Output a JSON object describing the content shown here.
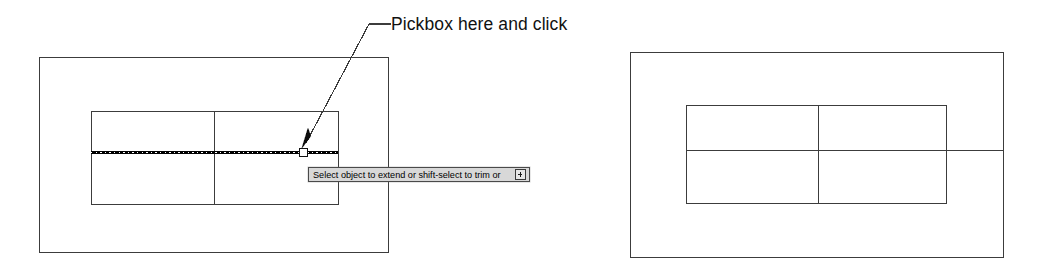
{
  "figure": {
    "annotation_label": "Pickbox here and click",
    "tooltip": {
      "text": "Select object to extend or shift-select to trim or",
      "icon": "expand-box-icon"
    },
    "colors": {
      "line": "#3c3c3c",
      "bold_line": "#000000",
      "tooltip_background": "#d8d8d8",
      "tooltip_border": "#4a4a4a",
      "text": "#111111",
      "background": "#ffffff"
    }
  },
  "panels": [
    {
      "name": "before-panel",
      "description": "Drawing before extend, with cursor pickbox on highlighted line",
      "outer_rect": {
        "x": 39,
        "y": 57,
        "width": 349,
        "height": 195
      },
      "inner_rect": {
        "x": 91,
        "y": 111,
        "width": 247,
        "height": 93
      },
      "vertical_divider_x": 214,
      "selected_line": {
        "x1": 91,
        "y": 152,
        "x2": 338,
        "style": "dashed-bold"
      },
      "pickbox": {
        "x": 303,
        "y": 148,
        "size": 8
      },
      "cursor_arrow": {
        "tip_x": 303,
        "tip_y": 146
      },
      "leader": {
        "start_x": 391,
        "start_y": 24,
        "elbow_x": 370,
        "elbow_y": 24,
        "end_x": 305,
        "end_y": 144
      }
    },
    {
      "name": "after-panel",
      "description": "Drawing after extend, line reaches outer rectangle edge",
      "outer_rect": {
        "x": 630,
        "y": 52,
        "width": 373,
        "height": 205
      },
      "inner_rect": {
        "x": 686,
        "y": 105,
        "width": 260,
        "height": 98
      },
      "vertical_divider_x": 818,
      "extended_line": {
        "x1": 686,
        "y": 150,
        "x2": 1003,
        "style": "solid"
      }
    }
  ]
}
